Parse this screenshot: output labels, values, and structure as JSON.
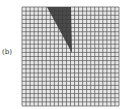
{
  "figure": {
    "panel_label": "(b)",
    "grid": {
      "x": 22,
      "y": 7,
      "width": 97,
      "height": 99,
      "cols": 24,
      "rows": 24,
      "line_color": "#555555",
      "background": "#e8e8e8"
    },
    "shaded_region": {
      "shape": "triangle",
      "points": [
        [
          47,
          7
        ],
        [
          71,
          7
        ],
        [
          72,
          53
        ]
      ],
      "color": "#3a3a3a"
    }
  }
}
